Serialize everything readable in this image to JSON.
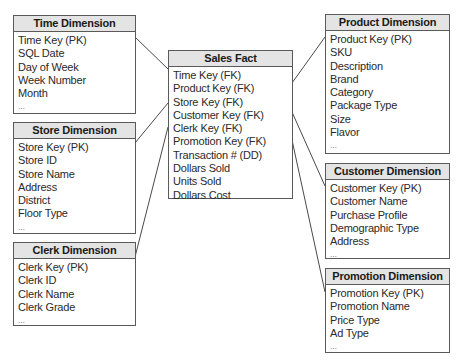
{
  "diagram": {
    "type": "star-schema",
    "fact": {
      "title": "Sales Fact",
      "fields": [
        "Time Key (FK)",
        "Product Key (FK)",
        "Store Key (FK)",
        "Customer Key (FK)",
        "Clerk Key (FK)",
        "Promotion Key (FK)",
        "Transaction # (DD)",
        "Dollars Sold",
        "Units Sold",
        "Dollars Cost"
      ]
    },
    "dimensions": {
      "time": {
        "title": "Time Dimension",
        "fields": [
          "Time Key (PK)",
          "SQL Date",
          "Day of Week",
          "Week Number",
          "Month",
          "..."
        ]
      },
      "store": {
        "title": "Store Dimension",
        "fields": [
          "Store Key (PK)",
          "Store ID",
          "Store Name",
          "Address",
          "District",
          "Floor Type",
          "..."
        ]
      },
      "clerk": {
        "title": "Clerk Dimension",
        "fields": [
          "Clerk Key (PK)",
          "Clerk ID",
          "Clerk Name",
          "Clerk Grade",
          "..."
        ]
      },
      "product": {
        "title": "Product Dimension",
        "fields": [
          "Product Key (PK)",
          "SKU",
          "Description",
          "Brand",
          "Category",
          "Package Type",
          "Size",
          "Flavor",
          "..."
        ]
      },
      "customer": {
        "title": "Customer Dimension",
        "fields": [
          "Customer Key (PK)",
          "Customer Name",
          "Purchase Profile",
          "Demographic Type",
          "Address",
          "..."
        ]
      },
      "promotion": {
        "title": "Promotion Dimension",
        "fields": [
          "Promotion Key (PK)",
          "Promotion Name",
          "Price Type",
          "Ad Type",
          "..."
        ]
      }
    },
    "links": [
      {
        "from": "time",
        "to": "fact",
        "field": "Time Key"
      },
      {
        "from": "store",
        "to": "fact",
        "field": "Store Key"
      },
      {
        "from": "clerk",
        "to": "fact",
        "field": "Clerk Key"
      },
      {
        "from": "product",
        "to": "fact",
        "field": "Product Key"
      },
      {
        "from": "customer",
        "to": "fact",
        "field": "Customer Key"
      },
      {
        "from": "promotion",
        "to": "fact",
        "field": "Promotion Key"
      }
    ],
    "colors": {
      "header_bg": "#e4e4e4",
      "border": "#5a5a5a",
      "text": "#222222"
    }
  }
}
